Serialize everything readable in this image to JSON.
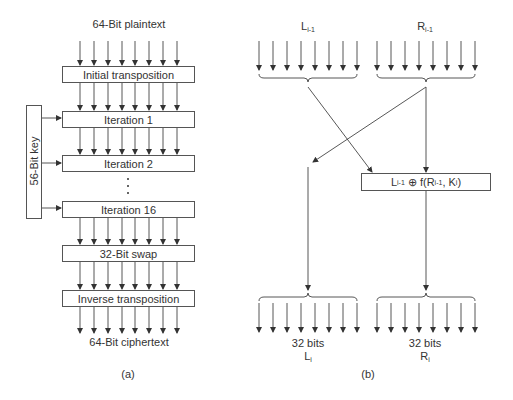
{
  "panel_a": {
    "input_label": "64-Bit plaintext",
    "stages": [
      {
        "label": "Initial transposition"
      },
      {
        "label": "Iteration 1"
      },
      {
        "label": "Iteration 2"
      },
      {
        "label": "Iteration 16"
      },
      {
        "label": "32-Bit swap"
      },
      {
        "label": "Inverse transposition"
      }
    ],
    "key_label": "56-Bit key",
    "ellipsis": "⋮",
    "output_label": "64-Bit ciphertext",
    "caption": "(a)"
  },
  "panel_b": {
    "left_input": {
      "main": "L",
      "sub": "i-1"
    },
    "right_input": {
      "main": "R",
      "sub": "i-1"
    },
    "function_box": {
      "l": "L",
      "l_sub": "i-1",
      "op": " ⊕ f(R",
      "r_sub": "i-1",
      "k": ", K",
      "k_sub": "i",
      "close": ")"
    },
    "left_output": {
      "bits": "32 bits",
      "main": "L",
      "sub": "i"
    },
    "right_output": {
      "bits": "32 bits",
      "main": "R",
      "sub": "i"
    },
    "caption": "(b)"
  },
  "colors": {
    "line": "#444444",
    "text": "#333333",
    "background": "#ffffff"
  }
}
